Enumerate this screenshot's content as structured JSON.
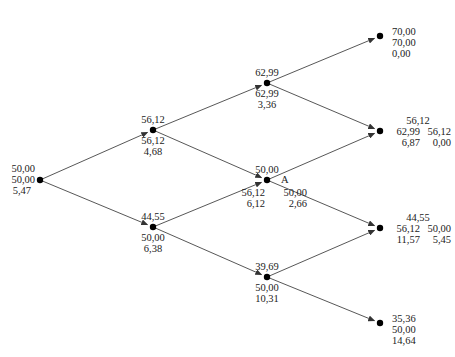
{
  "diagram": {
    "type": "binomial-tree",
    "line_color": "#444444",
    "node_color": "#000000",
    "nodes": [
      {
        "id": "root",
        "x": 40,
        "y": 180,
        "lines": [
          "50,00",
          "50,00",
          "5,47"
        ]
      },
      {
        "id": "u",
        "x": 153,
        "y": 130,
        "above": "56,12",
        "below": [
          "56,12",
          "4,68"
        ]
      },
      {
        "id": "d",
        "x": 153,
        "y": 227,
        "above": "44,55",
        "below": [
          "50,00",
          "6,38"
        ]
      },
      {
        "id": "uu",
        "x": 267,
        "y": 83,
        "above": "62,99",
        "below": [
          "62,99",
          "3,36"
        ]
      },
      {
        "id": "ud",
        "x": 267,
        "y": 180,
        "above": "50,00",
        "tag": "A",
        "below_left": [
          "56,12",
          "6,12"
        ],
        "below_right": [
          "50,00",
          "2,66"
        ]
      },
      {
        "id": "dd",
        "x": 267,
        "y": 277,
        "above": "39,69",
        "below": [
          "50,00",
          "10,31"
        ]
      },
      {
        "id": "uuu",
        "x": 380,
        "y": 36,
        "lines": [
          "70,00",
          "70,00",
          "0,00"
        ]
      },
      {
        "id": "uud",
        "x": 380,
        "y": 131,
        "top": "56,12",
        "left": [
          "62,99",
          "6,87"
        ],
        "right": [
          "56,12",
          "0,00"
        ]
      },
      {
        "id": "udd",
        "x": 380,
        "y": 228,
        "top": "44,55",
        "left": [
          "56,12",
          "11,57"
        ],
        "right": [
          "50,00",
          "5,45"
        ]
      },
      {
        "id": "ddd",
        "x": 380,
        "y": 323,
        "lines": [
          "35,36",
          "50,00",
          "14,64"
        ]
      }
    ],
    "edges": [
      [
        "root",
        "u"
      ],
      [
        "root",
        "d"
      ],
      [
        "u",
        "uu"
      ],
      [
        "u",
        "ud"
      ],
      [
        "d",
        "ud"
      ],
      [
        "d",
        "dd"
      ],
      [
        "uu",
        "uuu"
      ],
      [
        "uu",
        "uud"
      ],
      [
        "ud",
        "uud"
      ],
      [
        "ud",
        "udd"
      ],
      [
        "dd",
        "udd"
      ],
      [
        "dd",
        "ddd"
      ]
    ]
  }
}
